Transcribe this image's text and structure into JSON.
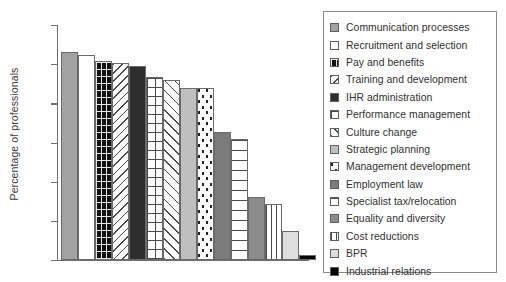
{
  "chart_data": {
    "type": "bar",
    "title": "",
    "xlabel": "",
    "ylabel": "Percentage of professionals",
    "ylim": [
      15,
      45
    ],
    "yticks": [
      15,
      20,
      25,
      30,
      35,
      40,
      45
    ],
    "grid": false,
    "legend_position": "right",
    "categories": [
      "Communication processes",
      "Recruitment and selection",
      "Pay and benefits",
      "Training and development",
      "IHR administration",
      "Performance management",
      "Culture change",
      "Strategic planning",
      "Management development",
      "Employment law",
      "Specialist tax/relocation",
      "Equality and diversity",
      "Cost reductions",
      "BPR",
      "Industrial relations"
    ],
    "values": [
      41.6,
      41.2,
      40.4,
      40.2,
      39.8,
      38.4,
      38.0,
      37.0,
      36.9,
      31.4,
      30.5,
      23.0,
      22.2,
      18.7,
      15.6
    ],
    "bar_patterns": [
      "solid-medium-gray",
      "white",
      "black-with-white-dot-grid",
      "backward-diagonal-hatch",
      "solid-dark",
      "cross-hatch-grid",
      "forward-diagonal-hatch",
      "solid-light-gray",
      "white-with-black-dots",
      "solid-dark-gray",
      "horizontal-lines",
      "solid-medium-dark-gray",
      "vertical-lines",
      "solid-very-light-gray",
      "solid-black"
    ]
  },
  "axis": {
    "y_label": "Percentage of professionals",
    "tick_labels": [
      "45",
      "40",
      "35",
      "30",
      "25",
      "20",
      "15"
    ]
  },
  "legend": {
    "items": [
      {
        "label": "Communication processes",
        "swatch": "solid-medium-gray"
      },
      {
        "label": "Recruitment and selection",
        "swatch": "white"
      },
      {
        "label": "Pay and benefits",
        "swatch": "cross-hatch-grid-dark"
      },
      {
        "label": "Training and development",
        "swatch": "backward-diagonal-hatch"
      },
      {
        "label": "IHR administration",
        "swatch": "solid-dark"
      },
      {
        "label": "Performance management",
        "swatch": "cross-hatch-grid"
      },
      {
        "label": "Culture change",
        "swatch": "forward-diagonal-hatch"
      },
      {
        "label": "Strategic planning",
        "swatch": "solid-light-gray"
      },
      {
        "label": "Management development",
        "swatch": "dotted-grid"
      },
      {
        "label": "Employment law",
        "swatch": "solid-dark-gray"
      },
      {
        "label": "Specialist tax/relocation",
        "swatch": "horizontal-lines"
      },
      {
        "label": "Equality and diversity",
        "swatch": "solid-medium-dark-gray"
      },
      {
        "label": "Cost reductions",
        "swatch": "vertical-lines"
      },
      {
        "label": "BPR",
        "swatch": "solid-very-light-gray"
      },
      {
        "label": "Industrial relations",
        "swatch": "solid-black"
      }
    ]
  },
  "colors": {
    "axis": "#6e6e6e",
    "text": "#2f2f2f",
    "bar_outline": "#6a6a6a",
    "legend_border": "#8a8a8a",
    "background": "#ffffff"
  }
}
